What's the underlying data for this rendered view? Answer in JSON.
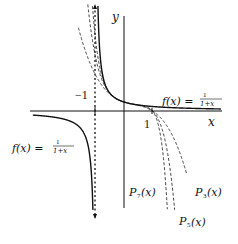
{
  "diagram": {
    "axes": {
      "x_label": "x",
      "y_label": "y",
      "tick_neg1": "−1",
      "tick_1": "1"
    },
    "labels": {
      "f_right": "f(x) =",
      "f_left": "f(x) =",
      "frac_num": "1",
      "frac_den": "1+x",
      "p7": "P",
      "p7_sub": "7",
      "p3": "P",
      "p3_sub": "3",
      "p5": "P",
      "p5_sub": "5",
      "arg": "(x)"
    },
    "curves": [
      {
        "name": "f(x) = 1/(1+x)",
        "style": "solid"
      },
      {
        "name": "P3(x)",
        "style": "dashed"
      },
      {
        "name": "P5(x)",
        "style": "dashed"
      },
      {
        "name": "P7(x)",
        "style": "dashed"
      },
      {
        "name": "asymptote x = -1",
        "style": "dotted"
      }
    ],
    "colors": {
      "ink": "#111111",
      "background": "#ffffff"
    }
  }
}
